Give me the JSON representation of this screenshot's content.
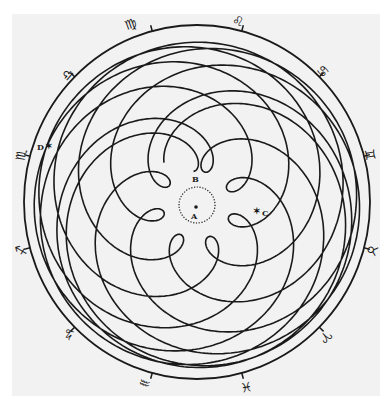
{
  "figure": {
    "ink_color": "#1a1a1a",
    "paper_color": "#f2f2f2",
    "center": [
      197,
      202
    ],
    "outer_ring": {
      "rx": 173,
      "ry": 177
    },
    "orbit_model": {
      "mars_radius": 1.524,
      "mars_period": 1.881,
      "earth_radius": 1.0,
      "earth_period": 1.0,
      "years": 16.9,
      "scale": 64.5,
      "rotation_deg": 96
    },
    "inner_dotted_circle": {
      "cx": 197,
      "cy": 205,
      "r": 18
    }
  },
  "points": [
    {
      "id": "A",
      "label": "A",
      "x": 196,
      "y": 207,
      "label_x": 191,
      "label_y": 219,
      "marker": "dot"
    },
    {
      "id": "B",
      "label": "B",
      "x": 197,
      "y": 178,
      "label_x": 192,
      "label_y": 182,
      "marker": "none"
    },
    {
      "id": "C",
      "label": "C",
      "x": 257,
      "y": 211,
      "label_x": 262,
      "label_y": 216,
      "marker": "star"
    },
    {
      "id": "D",
      "label": "D",
      "x": 49,
      "y": 146,
      "label_x": 37,
      "label_y": 150,
      "marker": "star"
    }
  ],
  "zodiac": [
    {
      "name": "virgo",
      "symbol": "♍",
      "x": 131,
      "y": 25,
      "rot": -20
    },
    {
      "name": "leo",
      "symbol": "♌",
      "x": 238,
      "y": 22,
      "rot": 12
    },
    {
      "name": "cancer",
      "symbol": "♋",
      "x": 322,
      "y": 72,
      "rot": 45
    },
    {
      "name": "gemini",
      "symbol": "♊",
      "x": 369,
      "y": 155,
      "rot": 80
    },
    {
      "name": "taurus",
      "symbol": "♉",
      "x": 371,
      "y": 250,
      "rot": 110
    },
    {
      "name": "aries",
      "symbol": "♈",
      "x": 325,
      "y": 336,
      "rot": 140
    },
    {
      "name": "pisces",
      "symbol": "♓",
      "x": 246,
      "y": 386,
      "rot": 170
    },
    {
      "name": "aquarius",
      "symbol": "♒",
      "x": 145,
      "y": 382,
      "rot": 200
    },
    {
      "name": "capricorn",
      "symbol": "♑",
      "x": 70,
      "y": 333,
      "rot": 225
    },
    {
      "name": "sagittarius",
      "symbol": "♐",
      "x": 22,
      "y": 250,
      "rot": 255
    },
    {
      "name": "scorpio",
      "symbol": "♏",
      "x": 22,
      "y": 155,
      "rot": 280
    },
    {
      "name": "libra",
      "symbol": "♎",
      "x": 68,
      "y": 75,
      "rot": 310
    }
  ],
  "tick_angles_deg": [
    75,
    45,
    15,
    -15,
    -45,
    -75,
    -105,
    -135,
    -165,
    165,
    135,
    105
  ]
}
